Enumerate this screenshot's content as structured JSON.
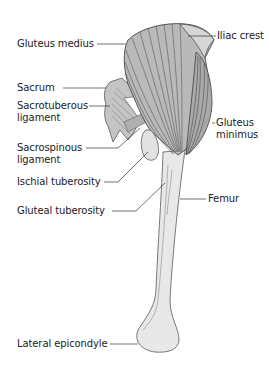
{
  "diagram": {
    "colors": {
      "muscle_fill": "#b9b9b9",
      "muscle_light": "#d2d2d2",
      "bone_fill": "#e6e6e6",
      "outline": "#555555",
      "leader": "#333333",
      "text": "#222222"
    },
    "labels": {
      "gluteus_medius": "Gluteus medius",
      "iliac_crest": "Iliac crest",
      "sacrum": "Sacrum",
      "sacrotuberous_1": "Sacrotuberous",
      "sacrotuberous_2": "ligament",
      "gluteus_minimus_1": "Gluteus",
      "gluteus_minimus_2": "minimus",
      "sacrospinous_1": "Sacrospinous",
      "sacrospinous_2": "ligament",
      "ischial_tuberosity": "Ischial tuberosity",
      "femur": "Femur",
      "gluteal_tuberosity": "Gluteal tuberosity",
      "lateral_epicondyle": "Lateral epicondyle"
    }
  }
}
